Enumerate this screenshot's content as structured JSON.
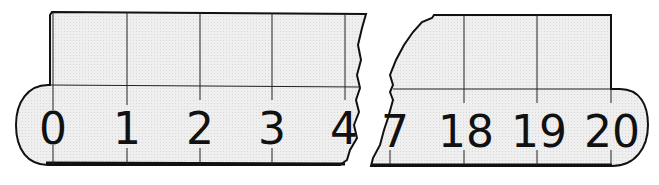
{
  "figure": {
    "left_piece": {
      "labels": [
        "0",
        "1",
        "2",
        "3",
        "4"
      ]
    },
    "right_piece": {
      "labels": [
        "7",
        "18",
        "19",
        "20"
      ]
    },
    "colors": {
      "fill": "#ececec",
      "stroke": "#111111",
      "background": "#ffffff"
    }
  }
}
